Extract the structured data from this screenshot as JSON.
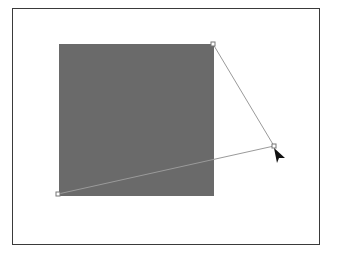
{
  "canvas": {
    "background": "#ffffff",
    "frame_color": "#3a3a3a"
  },
  "shape": {
    "type": "rectangle",
    "fill": "#6a6a6a",
    "x": 59,
    "y": 44,
    "width": 155,
    "height": 152
  },
  "path": {
    "stroke": "#9a9a9a",
    "anchors": [
      {
        "x": 213,
        "y": 44
      },
      {
        "x": 274,
        "y": 146
      },
      {
        "x": 58,
        "y": 194
      }
    ]
  },
  "cursor": {
    "icon": "arrow-pointer-icon",
    "x": 274,
    "y": 148,
    "color": "#111111"
  }
}
